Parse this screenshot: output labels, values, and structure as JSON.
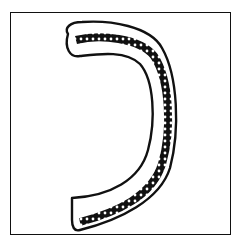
{
  "illustration": {
    "subject": "hand-drawn ornamental hook-shaped glyph with dotted inner band",
    "frame": true,
    "colors": {
      "ink": "#111111",
      "paper": "#ffffff"
    }
  }
}
